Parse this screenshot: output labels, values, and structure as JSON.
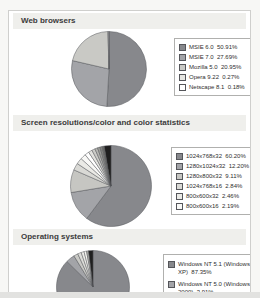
{
  "sections": [
    {
      "title": "Web browsers"
    },
    {
      "title": "Screen resolutions/color and color statistics"
    },
    {
      "title": "Operating systems"
    }
  ],
  "chart_data": [
    {
      "type": "pie",
      "title": "Web browsers",
      "legend_position": "right",
      "slice_stroke": "#55565a",
      "series": [
        {
          "label": "MSIE 6.0",
          "pct": "50.91%",
          "value": 50.91,
          "color": "#87888c"
        },
        {
          "label": "MSIE 7.0",
          "pct": "27.69%",
          "value": 27.69,
          "color": "#a3a4a8"
        },
        {
          "label": "Mozilla 5.0",
          "pct": "20.95%",
          "value": 20.95,
          "color": "#c9c9c5"
        },
        {
          "label": "Opera 9.22",
          "pct": "0.27%",
          "value": 0.27,
          "color": "#e6e6e2"
        },
        {
          "label": "Netscape 8.1",
          "pct": "0.18%",
          "value": 0.18,
          "color": "#ffffff"
        }
      ],
      "other_slices": []
    },
    {
      "type": "pie",
      "title": "Screen resolutions/color and color statistics",
      "legend_position": "right",
      "slice_stroke": "#55565a",
      "series": [
        {
          "label": "1024x768x32",
          "pct": "60.20%",
          "value": 60.2,
          "color": "#87888c"
        },
        {
          "label": "1280x1024x32",
          "pct": "12.20%",
          "value": 12.2,
          "color": "#a3a4a8"
        },
        {
          "label": "1280x800x32",
          "pct": "9.11%",
          "value": 9.11,
          "color": "#c6c6c2"
        },
        {
          "label": "1024x768x16",
          "pct": "2.84%",
          "value": 2.84,
          "color": "#d9d9d5"
        },
        {
          "label": "800x600x32",
          "pct": "2.46%",
          "value": 2.46,
          "color": "#eaeae6"
        },
        {
          "label": "800x600x16",
          "pct": "2.19%",
          "value": 2.19,
          "color": "#f8f8f6"
        }
      ],
      "other_slices": [
        {
          "value": 1.7,
          "color": "#ffffff"
        },
        {
          "value": 1.5,
          "color": "#e3e3df"
        },
        {
          "value": 1.3,
          "color": "#ccccc8"
        },
        {
          "value": 1.1,
          "color": "#b4b4b0"
        },
        {
          "value": 1.0,
          "color": "#9c9c98"
        },
        {
          "value": 0.9,
          "color": "#848480"
        },
        {
          "value": 0.8,
          "color": "#6a6a66"
        },
        {
          "value": 2.7,
          "color": "#1f1f1f"
        }
      ]
    },
    {
      "type": "pie",
      "title": "Operating systems",
      "legend_position": "right",
      "slice_stroke": "#55565a",
      "series": [
        {
          "label": "Windows NT 5.1 (Windows XP)",
          "pct": "87.35%",
          "value": 87.35,
          "color": "#87888c"
        },
        {
          "label": "Windows NT 5.0 (Windows 2000)",
          "pct": "3.91%",
          "value": 3.91,
          "color": "#a3a4a8"
        }
      ],
      "other_slices": [
        {
          "value": 1.9,
          "color": "#c9c9c5"
        },
        {
          "value": 1.6,
          "color": "#dcdcd8"
        },
        {
          "value": 1.3,
          "color": "#ebebe7"
        },
        {
          "value": 1.1,
          "color": "#f6f6f2"
        },
        {
          "value": 0.9,
          "color": "#aeaeaa"
        },
        {
          "value": 1.94,
          "color": "#1f1f1f"
        }
      ]
    }
  ]
}
